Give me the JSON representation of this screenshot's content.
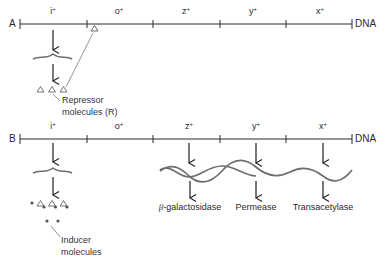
{
  "panels": [
    {
      "letter": "A",
      "genes": [
        {
          "name": "i",
          "sup": "+"
        },
        {
          "name": "o",
          "sup": "+"
        },
        {
          "name": "z",
          "sup": "+"
        },
        {
          "name": "y",
          "sup": "+"
        },
        {
          "name": "x",
          "sup": "+"
        }
      ],
      "dna_label": "DNA",
      "annotation": {
        "line1": "Repressor",
        "line2": "molecules (R)"
      }
    },
    {
      "letter": "B",
      "genes": [
        {
          "name": "i",
          "sup": "+"
        },
        {
          "name": "o",
          "sup": "+"
        },
        {
          "name": "z",
          "sup": "+"
        },
        {
          "name": "y",
          "sup": "+"
        },
        {
          "name": "x",
          "sup": "+"
        }
      ],
      "dna_label": "DNA",
      "annotation": {
        "line1": "Inducer",
        "line2": "molecules"
      },
      "products": [
        {
          "prefix": "β",
          "name": "-galactosidase"
        },
        {
          "prefix": "",
          "name": "Permease"
        },
        {
          "prefix": "",
          "name": "Transacetylase"
        }
      ]
    }
  ],
  "colors": {
    "line": "#2b2b2b",
    "mrna": "#6e6e6e",
    "text": "#2a2a2a"
  }
}
